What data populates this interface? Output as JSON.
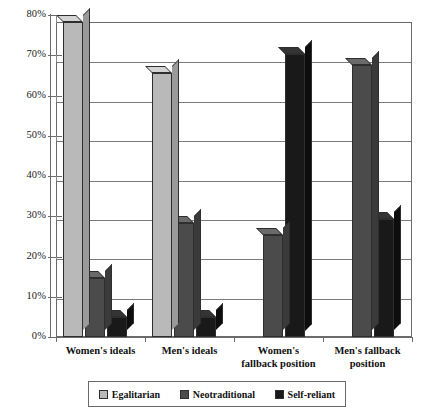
{
  "chart_data": {
    "type": "bar",
    "title": "",
    "subtitle": "",
    "xlabel": "",
    "ylabel": "",
    "ylim": [
      0,
      80
    ],
    "ytick_labels": [
      "0%",
      "10%",
      "20%",
      "30%",
      "40%",
      "50%",
      "60%",
      "70%",
      "80%"
    ],
    "ytick_values": [
      0,
      10,
      20,
      30,
      40,
      50,
      60,
      70,
      80
    ],
    "grid": true,
    "legend_position": "bottom",
    "style": "3d-column",
    "categories": [
      "Women's ideals",
      "Men's ideals",
      "Women's\nfallback position",
      "Men's fallback\nposition"
    ],
    "series": [
      {
        "name": "Egalitarian",
        "color": "#b9b9b9",
        "side_color": "#9a9a9a",
        "cap_color": "#d3d3d3",
        "values": [
          80,
          67,
          0,
          0
        ]
      },
      {
        "name": "Neotraditional",
        "color": "#4b4b4b",
        "side_color": "#3a3a3a",
        "cap_color": "#6a6a6a",
        "values": [
          15,
          29,
          26,
          69
        ]
      },
      {
        "name": "Self-reliant",
        "color": "#191919",
        "side_color": "#0d0d0d",
        "cap_color": "#343434",
        "values": [
          5,
          5,
          72,
          30
        ]
      }
    ]
  },
  "legend": {
    "items": [
      {
        "label": "Egalitarian"
      },
      {
        "label": "Neotraditional"
      },
      {
        "label": "Self-reliant"
      }
    ]
  },
  "colors": {
    "egalitarian": "#b9b9b9",
    "neotraditional": "#4b4b4b",
    "self_reliant": "#191919",
    "axis": "#6b6b6b",
    "grid": "#7a7a7a",
    "background": "#ffffff"
  }
}
